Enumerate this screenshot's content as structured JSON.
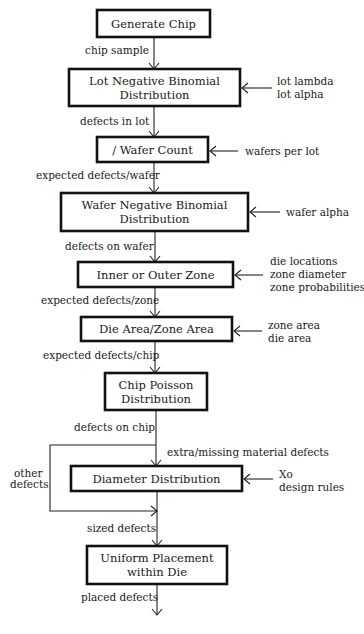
{
  "diagram": {
    "boxes": [
      {
        "id": "generate-chip",
        "lines": [
          "Generate Chip"
        ],
        "x": 97,
        "y": 10,
        "w": 113,
        "h": 27
      },
      {
        "id": "lot-negative-binomial",
        "lines": [
          "Lot Negative Binomial",
          "Distribution"
        ],
        "x": 69,
        "y": 69,
        "w": 171,
        "h": 37
      },
      {
        "id": "wafer-count",
        "lines": [
          "/ Wafer Count"
        ],
        "x": 97,
        "y": 137,
        "w": 111,
        "h": 25
      },
      {
        "id": "wafer-negative-binomial",
        "lines": [
          "Wafer Negative Binomial",
          "Distribution"
        ],
        "x": 61,
        "y": 193,
        "w": 187,
        "h": 38
      },
      {
        "id": "inner-outer-zone",
        "lines": [
          "Inner or Outer Zone"
        ],
        "x": 78,
        "y": 262,
        "w": 155,
        "h": 25
      },
      {
        "id": "die-area-zone-area",
        "lines": [
          "Die Area/Zone Area"
        ],
        "x": 81,
        "y": 317,
        "w": 151,
        "h": 24
      },
      {
        "id": "chip-poisson",
        "lines": [
          "Chip Poisson",
          "Distribution"
        ],
        "x": 105,
        "y": 373,
        "w": 102,
        "h": 37
      },
      {
        "id": "diameter-distribution",
        "lines": [
          "Diameter Distribution"
        ],
        "x": 71,
        "y": 466,
        "w": 171,
        "h": 25
      },
      {
        "id": "uniform-placement",
        "lines": [
          "Uniform Placement",
          "within Die"
        ],
        "x": 87,
        "y": 546,
        "w": 140,
        "h": 38
      }
    ],
    "flow_labels": [
      {
        "id": "chip-sample",
        "text": "chip sample",
        "x": 85,
        "y": 54
      },
      {
        "id": "defects-in-lot",
        "text": "defects in lot",
        "x": 80,
        "y": 125
      },
      {
        "id": "expected-defects-wafer",
        "text": "expected defects/wafer",
        "x": 36,
        "y": 179
      },
      {
        "id": "defects-on-wafer",
        "text": "defects on wafer",
        "x": 65,
        "y": 250
      },
      {
        "id": "expected-defects-zone",
        "text": "expected defects/zone",
        "x": 41,
        "y": 304
      },
      {
        "id": "expected-defects-chip",
        "text": "expected defects/chip",
        "x": 43,
        "y": 359
      },
      {
        "id": "defects-on-chip",
        "text": "defects on chip",
        "x": 74,
        "y": 431
      },
      {
        "id": "extra-missing-material-defects",
        "text": "extra/missing material defects",
        "x": 167,
        "y": 456
      },
      {
        "id": "other-defects-1",
        "text": "other",
        "x": 14,
        "y": 477
      },
      {
        "id": "other-defects-2",
        "text": "defects",
        "x": 10,
        "y": 488
      },
      {
        "id": "sized-defects",
        "text": "sized defects",
        "x": 87,
        "y": 532
      },
      {
        "id": "placed-defects",
        "text": "placed defects",
        "x": 81,
        "y": 601
      }
    ],
    "inputs": [
      {
        "id": "lot-inputs",
        "target_y": 88,
        "box_right": 240,
        "line_end": 272,
        "text_x": 277,
        "lines": [
          "lot lambda",
          "lot alpha"
        ],
        "text_y": 85
      },
      {
        "id": "wafer-count-inputs",
        "target_y": 151,
        "box_right": 208,
        "line_end": 238,
        "text_x": 245,
        "lines": [
          "wafers per lot"
        ],
        "text_y": 155
      },
      {
        "id": "wafer-inputs",
        "target_y": 212,
        "box_right": 248,
        "line_end": 280,
        "text_x": 286,
        "lines": [
          "wafer alpha"
        ],
        "text_y": 216
      },
      {
        "id": "zone-inputs",
        "target_y": 275,
        "box_right": 233,
        "line_end": 263,
        "text_x": 270,
        "lines": [
          "die locations",
          "zone diameter",
          "zone probabilities"
        ],
        "text_y": 265
      },
      {
        "id": "area-inputs",
        "target_y": 331,
        "box_right": 232,
        "line_end": 262,
        "text_x": 268,
        "lines": [
          "zone area",
          "die area"
        ],
        "text_y": 329
      },
      {
        "id": "diameter-inputs",
        "target_y": 479,
        "box_right": 242,
        "line_end": 273,
        "text_x": 279,
        "lines": [
          "Xo",
          "design rules"
        ],
        "text_y": 478
      }
    ],
    "colors": {
      "stroke": "#111111",
      "text": "#1a1a1a",
      "background": "#ffffff"
    }
  }
}
